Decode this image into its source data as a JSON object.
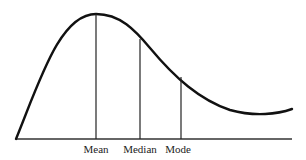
{
  "diagram": {
    "line_color": "#111111",
    "labels": {
      "mean": "Mean",
      "median": "Median",
      "mode": "Mode"
    },
    "markers": [
      {
        "name": "Mean",
        "x": 96,
        "top_y": 14
      },
      {
        "name": "Median",
        "x": 140,
        "top_y": 40
      },
      {
        "name": "Mode",
        "x": 181,
        "top_y": 78
      }
    ],
    "baseline": {
      "x1": 16,
      "x2": 292,
      "y": 139
    }
  }
}
